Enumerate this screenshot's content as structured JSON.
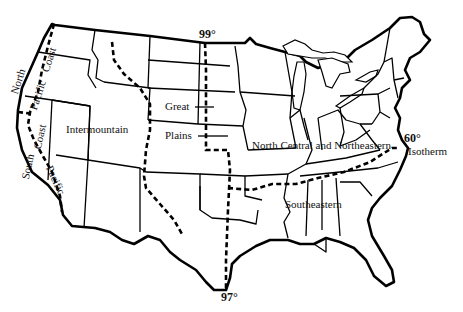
{
  "map": {
    "title": "United States regions map",
    "colors": {
      "lines": "#000000",
      "background": "#ffffff"
    },
    "regions": [
      {
        "id": "north-pacific-coast",
        "label_parts": [
          "North",
          "Pacific",
          "Coast"
        ]
      },
      {
        "id": "south-pacific-coast",
        "label_parts": [
          "South",
          "Pacific",
          "Coast"
        ]
      },
      {
        "id": "intermountain",
        "label": "Intermountain"
      },
      {
        "id": "great-plains",
        "label_parts": [
          "Great",
          "Plains"
        ]
      },
      {
        "id": "north-central-northeastern",
        "label": "North Central and Northeastern"
      },
      {
        "id": "southeastern",
        "label": "Southeastern"
      }
    ],
    "annotations": {
      "meridian_north": "99°",
      "meridian_south": "97°",
      "isotherm_value": "60°",
      "isotherm_label": "Isotherm"
    }
  }
}
